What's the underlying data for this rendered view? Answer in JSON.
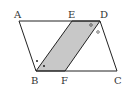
{
  "figure": {
    "type": "parallelogram with inscribed shaded parallelogram",
    "points": {
      "A": {
        "label": "A",
        "x": 19,
        "y": 21
      },
      "E": {
        "label": "E",
        "x": 72,
        "y": 21
      },
      "D": {
        "label": "D",
        "x": 100,
        "y": 21
      },
      "B": {
        "label": "B",
        "x": 36,
        "y": 71
      },
      "F": {
        "label": "F",
        "x": 65,
        "y": 71
      },
      "C": {
        "label": "C",
        "x": 117,
        "y": 71
      }
    },
    "shaded_region": "BFDE",
    "angle_marks": {
      "B": "dot (two equal angles)",
      "D": "circle (two equal angles)"
    },
    "colors": {
      "stroke": "#222222",
      "fill": "#c8c8c8",
      "label": "#333333"
    }
  }
}
